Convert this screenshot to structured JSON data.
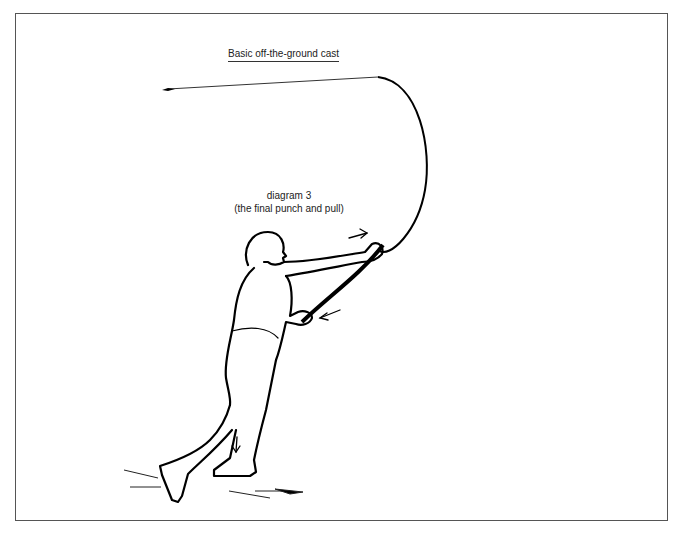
{
  "diagram": {
    "title": "Basic off-the-ground cast",
    "caption_line1": "diagram 3",
    "caption_line2": "(the final punch and pull)",
    "elements": [
      "fishing-rod",
      "casting-line",
      "lead-weight",
      "angler-figure",
      "motion-arrows",
      "ground-lines"
    ],
    "stroke_color": "#000000",
    "background_color": "#ffffff",
    "frame_color": "#555555"
  }
}
